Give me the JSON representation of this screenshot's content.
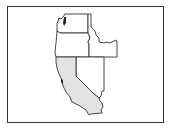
{
  "map": {
    "region": "Western United States",
    "highlighted_state": "California",
    "colors": {
      "border": "#333333",
      "highlight_fill": "#e3e3e3",
      "default_fill": "#ffffff",
      "background": "#ffffff"
    },
    "states": [
      {
        "name": "Washington",
        "highlighted": false
      },
      {
        "name": "Oregon",
        "highlighted": false
      },
      {
        "name": "Idaho",
        "highlighted": false
      },
      {
        "name": "Nevada",
        "highlighted": false
      },
      {
        "name": "California",
        "highlighted": true
      }
    ]
  }
}
